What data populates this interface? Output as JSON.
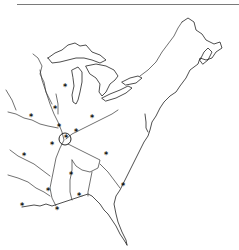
{
  "map": {
    "title": "",
    "region": "Eastern North America (Great Lakes, Mississippi basin, Atlantic & Gulf coasts)",
    "style": {
      "line_color": "#222222",
      "background": "#ffffff",
      "rule_color": "#7a7a7a"
    },
    "marker_glyph": "*",
    "markers": [
      {
        "x": 65,
        "y": 88
      },
      {
        "x": 55,
        "y": 110
      },
      {
        "x": 31,
        "y": 118
      },
      {
        "x": 59,
        "y": 128
      },
      {
        "x": 92,
        "y": 119
      },
      {
        "x": 66,
        "y": 139
      },
      {
        "x": 76,
        "y": 133
      },
      {
        "x": 52,
        "y": 146
      },
      {
        "x": 24,
        "y": 157
      },
      {
        "x": 106,
        "y": 156
      },
      {
        "x": 71,
        "y": 176
      },
      {
        "x": 48,
        "y": 192
      },
      {
        "x": 79,
        "y": 197
      },
      {
        "x": 123,
        "y": 187
      },
      {
        "x": 57,
        "y": 211
      },
      {
        "x": 22,
        "y": 207
      }
    ],
    "highlight_circle": {
      "cx": 65,
      "cy": 139,
      "r": 6
    }
  }
}
